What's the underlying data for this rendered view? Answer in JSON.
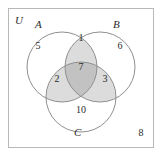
{
  "diagram": {
    "type": "venn-3-set",
    "title_visible": false,
    "universe_label": "U",
    "set_labels": {
      "a": "A",
      "b": "B",
      "c": "C"
    },
    "region_counts": {
      "a_only": "5",
      "b_only": "6",
      "c_only": "10",
      "a_and_b": "1",
      "a_and_c": "2",
      "b_and_c": "3",
      "a_and_b_and_c": "7",
      "outside_all": "8"
    },
    "colors": {
      "frame_stroke": "#b8b8b8",
      "circle_stroke": "#8f8f8f",
      "background": "#ffffff",
      "pair_intersection_fill": "#dcdcdc",
      "triple_intersection_fill": "#c2c2c2",
      "text": "#2b2b2b"
    },
    "geometry": {
      "circle_a": {
        "cx": 62,
        "cy": 67,
        "r": 35
      },
      "circle_b": {
        "cx": 100,
        "cy": 67,
        "r": 35
      },
      "circle_c": {
        "cx": 81,
        "cy": 97,
        "r": 35
      }
    }
  }
}
